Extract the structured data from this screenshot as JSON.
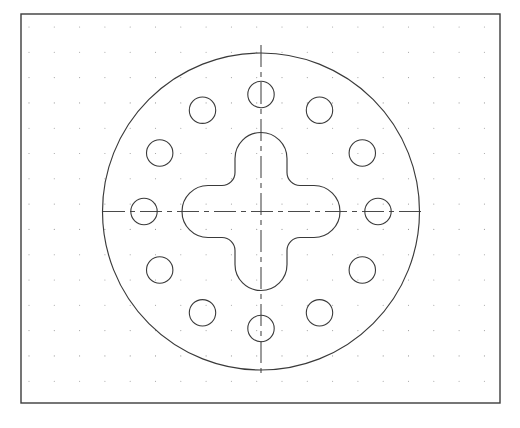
{
  "view": {
    "width": 520,
    "height": 428,
    "background": "#ffffff",
    "title": "Circular flange plate with cruciform central cutout and 12-hole bolt circle",
    "drawing_type": "orthographic-front-view"
  },
  "frame": {
    "name": "drawing-border",
    "x": 21,
    "y": 14,
    "width": 479,
    "height": 389,
    "stroke": "#3c3c3c",
    "stroke_width": 1.4,
    "fill": "#ffffff"
  },
  "grid": {
    "name": "snap-dot-grid",
    "visible": true,
    "origin_x": 29,
    "origin_y": 27,
    "spacing": 25.3,
    "columns": 19,
    "rows": 15,
    "dot_radius": 0.55,
    "color": "#9a9a9a"
  },
  "geometry": {
    "center": {
      "x": 261,
      "y": 211.5
    },
    "outer_circle": {
      "name": "outer-plate-circle",
      "cx": 261,
      "cy": 211.5,
      "r": 158.5,
      "stroke": "#3a3a3a",
      "stroke_width": 1.15,
      "fill": "none"
    },
    "cross_cutout": {
      "name": "cruciform-cutout",
      "arm_half_width": 26,
      "arm_reach": 79,
      "corner_fillet": 13,
      "tip_radius": 26,
      "left": 182,
      "right": 340,
      "top": 132.5,
      "bottom": 290.5,
      "stroke": "#3a3a3a",
      "stroke_width": 1.15,
      "fill": "none"
    },
    "bolt_circle": {
      "name": "bolt-hole-pattern",
      "count": 12,
      "pitch_radius": 117,
      "hole_radius": 13.2,
      "start_angle_deg": -90,
      "angle_step_deg": 30,
      "stroke": "#3a3a3a",
      "stroke_width": 1.1,
      "fill": "none"
    },
    "centerlines": {
      "name": "center-axes",
      "stroke": "#4a4a4a",
      "stroke_width": 1.1,
      "dash_pattern": "22 5 5 5",
      "horizontal": {
        "x1": 103,
        "y1": 211.5,
        "x2": 424,
        "y2": 211.5
      },
      "vertical": {
        "x1": 261,
        "y1": 45,
        "x2": 261,
        "y2": 378
      }
    }
  },
  "holes": [
    {
      "label": "hole-01",
      "angle_deg": -90,
      "cx": 261.0,
      "cy": 94.5
    },
    {
      "label": "hole-02",
      "angle_deg": -60,
      "cx": 319.5,
      "cy": 110.2
    },
    {
      "label": "hole-03",
      "angle_deg": -30,
      "cx": 362.3,
      "cy": 153.0
    },
    {
      "label": "hole-04",
      "angle_deg": 0,
      "cx": 378.0,
      "cy": 211.5
    },
    {
      "label": "hole-05",
      "angle_deg": 30,
      "cx": 362.3,
      "cy": 270.0
    },
    {
      "label": "hole-06",
      "angle_deg": 60,
      "cx": 319.5,
      "cy": 312.8
    },
    {
      "label": "hole-07",
      "angle_deg": 90,
      "cx": 261.0,
      "cy": 328.5
    },
    {
      "label": "hole-08",
      "angle_deg": 120,
      "cx": 202.5,
      "cy": 312.8
    },
    {
      "label": "hole-09",
      "angle_deg": 150,
      "cx": 159.7,
      "cy": 270.0
    },
    {
      "label": "hole-10",
      "angle_deg": 180,
      "cx": 144.0,
      "cy": 211.5
    },
    {
      "label": "hole-11",
      "angle_deg": 210,
      "cx": 159.7,
      "cy": 153.0
    },
    {
      "label": "hole-12",
      "angle_deg": 240,
      "cx": 202.5,
      "cy": 110.2
    }
  ]
}
